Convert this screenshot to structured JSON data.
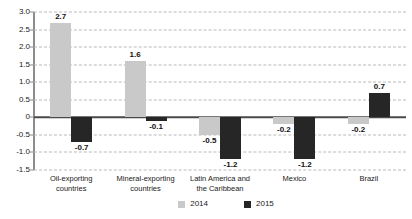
{
  "chart_data": {
    "type": "bar",
    "title": "",
    "subtitle": "",
    "xlabel": "",
    "ylabel": "",
    "ylim": [
      -1.5,
      3.0
    ],
    "ytick_step": 0.5,
    "ytick_labels": [
      "3.0",
      "2.5",
      "2.0",
      "1.5",
      "1.0",
      "0.5",
      "0",
      "-0.5",
      "-1.0",
      "-1.5"
    ],
    "ytick_values": [
      3.0,
      2.5,
      2.0,
      1.5,
      1.0,
      0.5,
      0,
      -0.5,
      -1.0,
      -1.5
    ],
    "grid": true,
    "grid_style": "dashed-horizontal",
    "legend_position": "bottom-center",
    "categories": [
      "Oil-exporting\ncountries",
      "Mineral-exporting\ncountries",
      "Latin America and\nthe Caribbean",
      "Mexico",
      "Brazil"
    ],
    "series": [
      {
        "name": "2014",
        "color": "#c9c9c9",
        "values": [
          2.7,
          1.6,
          -0.5,
          -0.2,
          -0.2
        ],
        "labels": [
          "2.7",
          "1.6",
          "-0.5",
          "-0.2",
          "-0.2"
        ]
      },
      {
        "name": "2015",
        "color": "#262626",
        "values": [
          -0.7,
          -0.1,
          -1.2,
          -1.2,
          0.7
        ],
        "labels": [
          "-0.7",
          "-0.1",
          "-1.2",
          "-1.2",
          "0.7"
        ]
      }
    ]
  },
  "legend": {
    "items": [
      {
        "label": "2014",
        "color": "#c9c9c9"
      },
      {
        "label": "2015",
        "color": "#262626"
      }
    ]
  },
  "axis": {
    "zero_label": "0"
  }
}
